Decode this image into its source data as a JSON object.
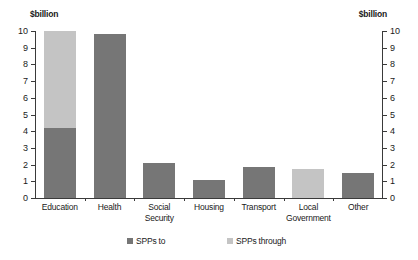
{
  "chart_data": {
    "type": "bar",
    "title": "",
    "subtitle": "",
    "xlabel": "",
    "ylabel": "$billion",
    "ylabel_right": "$billion",
    "ylim": [
      0,
      10
    ],
    "ytick_labels": [
      "10",
      "9",
      "8",
      "7",
      "6",
      "5",
      "4",
      "3",
      "2",
      "1",
      "0"
    ],
    "ytick_values": [
      10,
      9,
      8,
      7,
      6,
      5,
      4,
      3,
      2,
      1,
      0
    ],
    "grid": false,
    "stacked": true,
    "legend_position": "bottom",
    "categories": [
      "Education",
      "Health",
      "Social Security",
      "Housing",
      "Transport",
      "Local Government",
      "Other"
    ],
    "category_label_lines": [
      "Education",
      "Health",
      "Social\nSecurity",
      "Housing",
      "Transport",
      "Local\nGovernment",
      "Other"
    ],
    "series": [
      {
        "name": "SPPs to",
        "color": "#767676",
        "values": [
          4.2,
          9.8,
          2.1,
          1.1,
          1.85,
          0,
          1.5
        ]
      },
      {
        "name": "SPPs through",
        "color": "#c4c4c4",
        "values": [
          5.8,
          0,
          0,
          0,
          0,
          1.75,
          0
        ]
      }
    ],
    "totals": [
      10,
      9.8,
      2.1,
      1.1,
      1.85,
      1.75,
      1.5
    ]
  },
  "legend": {
    "items": [
      {
        "label": "SPPs to",
        "color": "#767676"
      },
      {
        "label": "SPPs through",
        "color": "#c4c4c4"
      }
    ]
  },
  "colors": {
    "series_to": "#767676",
    "series_through": "#c4c4c4",
    "axis": "#3a3a3a",
    "text": "#1a1a1a",
    "background": "#ffffff"
  }
}
